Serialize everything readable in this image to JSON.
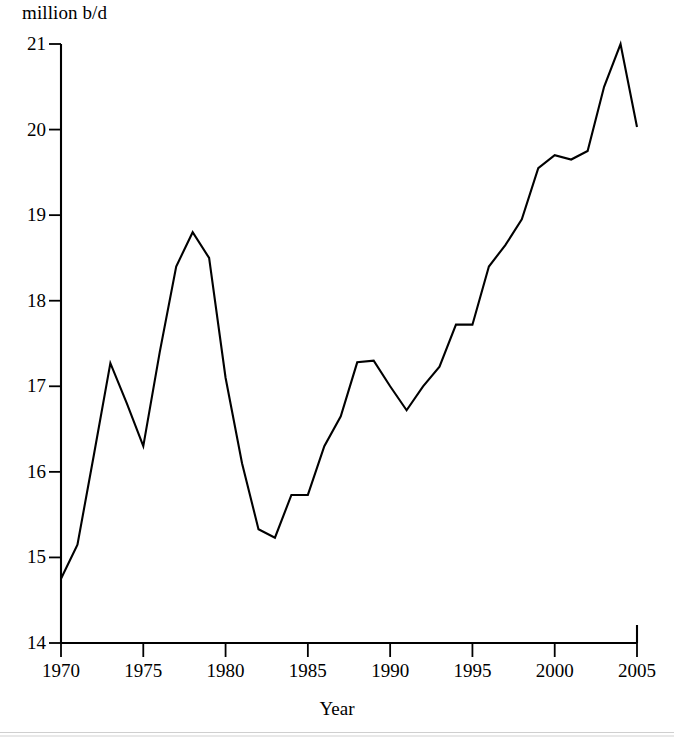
{
  "chart_data": {
    "type": "line",
    "title": "",
    "subtitle": "",
    "xlabel": "Year",
    "ylabel": "million b/d",
    "ylabel_position": "top-left",
    "grid": false,
    "legend": false,
    "legend_position": "none",
    "line_color": "#000000",
    "background_color": "#ffffff",
    "axis_color": "#000000",
    "xlim": [
      1970,
      2005
    ],
    "ylim": [
      14,
      21
    ],
    "x_tick_labels": [
      "1970",
      "1975",
      "1980",
      "1985",
      "1990",
      "1995",
      "2000",
      "2005"
    ],
    "x_ticks": [
      1970,
      1975,
      1980,
      1985,
      1990,
      1995,
      2000,
      2005
    ],
    "y_tick_labels": [
      "14",
      "15",
      "16",
      "17",
      "18",
      "19",
      "20",
      "21"
    ],
    "y_ticks": [
      14,
      15,
      16,
      17,
      18,
      19,
      20,
      21
    ],
    "x": [
      1970,
      1971,
      1972,
      1973,
      1974,
      1975,
      1976,
      1977,
      1978,
      1979,
      1980,
      1981,
      1982,
      1983,
      1984,
      1985,
      1986,
      1987,
      1988,
      1989,
      1990,
      1991,
      1992,
      1993,
      1994,
      1995,
      1996,
      1997,
      1998,
      1999,
      2000,
      2001,
      2002,
      2003,
      2004,
      2005
    ],
    "values": [
      14.75,
      15.15,
      16.2,
      17.27,
      16.8,
      16.3,
      17.4,
      18.4,
      18.8,
      18.5,
      17.1,
      16.1,
      15.33,
      15.23,
      15.73,
      15.73,
      16.3,
      16.65,
      17.28,
      17.3,
      17.0,
      16.72,
      17.0,
      17.23,
      17.72,
      17.72,
      18.4,
      18.65,
      18.95,
      19.55,
      19.7,
      19.65,
      19.75,
      20.5,
      21.0,
      20.03
    ]
  },
  "yaxis": {
    "title": "million b/d"
  },
  "xaxis": {
    "title": "Year"
  }
}
